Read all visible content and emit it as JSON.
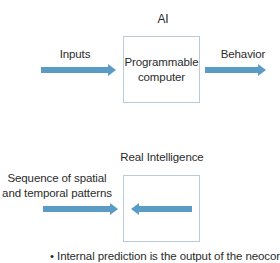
{
  "colors": {
    "arrow": "#5b9cc6",
    "box_border": "#b9cad8",
    "text": "#2b2b2b"
  },
  "ai_section": {
    "title": "AI",
    "input_label": "Inputs",
    "box_label_line1": "Programmable",
    "box_label_line2": "computer",
    "output_label": "Behavior",
    "arrows": [
      {
        "name": "inputs-arrow",
        "direction": "right"
      },
      {
        "name": "behavior-arrow",
        "direction": "right"
      }
    ]
  },
  "real_section": {
    "title": "Real Intelligence",
    "input_label_line1": "Sequence of spatial",
    "input_label_line2": "and temporal patterns",
    "arrows": [
      {
        "name": "patterns-arrow",
        "direction": "right"
      },
      {
        "name": "internal-prediction-arrow",
        "direction": "left"
      }
    ]
  },
  "bullet": {
    "symbol": "•",
    "text": "Internal prediction is the output of the neocortex."
  }
}
